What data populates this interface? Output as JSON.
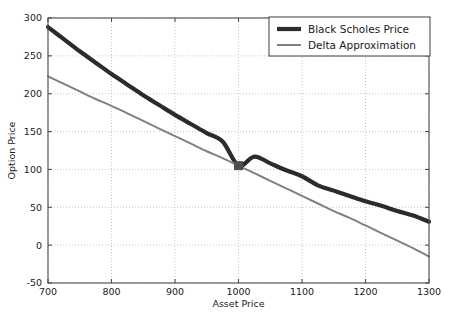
{
  "chart_data": {
    "type": "line",
    "title": "",
    "xlabel": "Asset Price",
    "ylabel": "Option Price",
    "xlim": [
      700,
      1300
    ],
    "ylim": [
      -50,
      300
    ],
    "xticks": [
      700,
      800,
      900,
      1000,
      1100,
      1200,
      1300
    ],
    "yticks": [
      -50,
      0,
      50,
      100,
      150,
      200,
      250,
      300
    ],
    "xtick_labels": [
      "700",
      "800",
      "900",
      "1000",
      "1100",
      "1200",
      "1300"
    ],
    "ytick_labels": [
      "-50",
      "0",
      "50",
      "100",
      "150",
      "200",
      "250",
      "300"
    ],
    "grid": true,
    "legend_position": "upper right",
    "x": [
      700,
      725,
      750,
      775,
      800,
      825,
      850,
      875,
      900,
      925,
      950,
      975,
      1000,
      1025,
      1050,
      1075,
      1100,
      1125,
      1150,
      1175,
      1200,
      1225,
      1250,
      1275,
      1300
    ],
    "series": [
      {
        "name": "Black Scholes Price",
        "color": "#2b2b2b",
        "linewidth": 4.2,
        "values": [
          288,
          272,
          256,
          241,
          226,
          212,
          198,
          185,
          172,
          160,
          148,
          137,
          105,
          117,
          108,
          99,
          91,
          79,
          72,
          65,
          58,
          52,
          45,
          39,
          31
        ]
      },
      {
        "name": "Delta Approximation",
        "color": "#808080",
        "linewidth": 2.0,
        "values": [
          223,
          213,
          203,
          193,
          184,
          174,
          164,
          154,
          144,
          134,
          124,
          115,
          105,
          95,
          85,
          75,
          65,
          55,
          45,
          36,
          26,
          16,
          6,
          -4,
          -15
        ]
      }
    ],
    "markers": [
      {
        "name": "tangency-point",
        "x": 1000,
        "y": 105,
        "shape": "square",
        "color": "#4f4f4f",
        "size": 9
      }
    ],
    "legend_entries": [
      {
        "label": "Black Scholes Price",
        "color": "#2b2b2b",
        "linewidth": 4.2
      },
      {
        "label": "Delta Approximation",
        "color": "#808080",
        "linewidth": 2.0
      }
    ]
  }
}
